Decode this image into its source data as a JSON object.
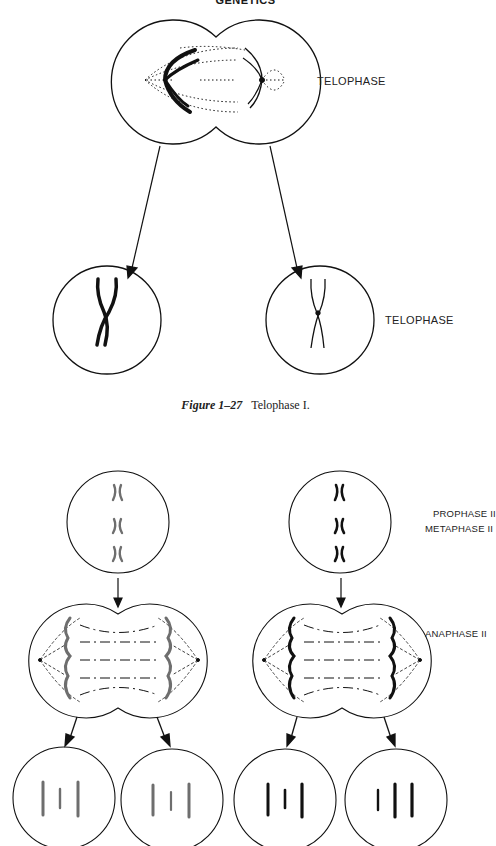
{
  "page": {
    "running_header": "GENETICS"
  },
  "figure_1_27": {
    "caption_number": "Figure 1–27",
    "caption_text": "Telophase I.",
    "labels": {
      "top_cell": "TELOPHASE",
      "daughter_cells": "TELOPHASE"
    }
  },
  "meiosis_ii_figure": {
    "labels": {
      "prophase": "PROPHASE II",
      "metaphase": "METAPHASE II",
      "anaphase": "ANAPHASE II"
    },
    "colors": {
      "left_lineage": "#6e6e6e",
      "right_lineage": "#111111"
    }
  }
}
